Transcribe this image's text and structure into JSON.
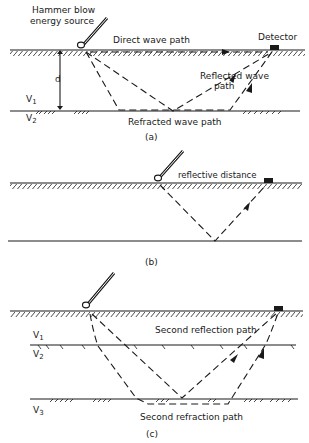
{
  "figure": {
    "panels": [
      {
        "id": "a",
        "caption": "(a)",
        "labels": {
          "source_line1": "Hammer blow",
          "source_line2": "energy source",
          "direct": "Direct wave path",
          "detector": "Detector",
          "depth": "d",
          "v1": "V",
          "v1_sub": "1",
          "v2": "V",
          "v2_sub": "2",
          "reflected_line1": "Reflected wave",
          "reflected_line2": "path",
          "refracted": "Refracted wave path"
        }
      },
      {
        "id": "b",
        "caption": "(b)",
        "labels": {
          "reflective": "reflective distance"
        }
      },
      {
        "id": "c",
        "caption": "(c)",
        "labels": {
          "v1": "V",
          "v1_sub": "1",
          "v2": "V",
          "v2_sub": "2",
          "v3": "V",
          "v3_sub": "3",
          "second_reflection": "Second reflection path",
          "second_refraction": "Second refraction path"
        }
      }
    ]
  }
}
